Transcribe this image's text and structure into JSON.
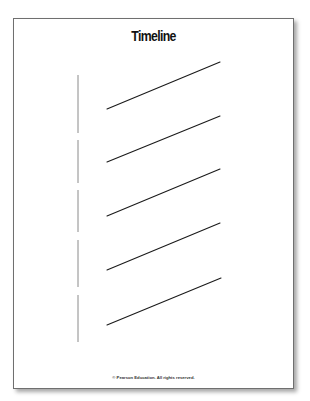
{
  "worksheet": {
    "title": "Timeline",
    "footer": "© Pearson Education. All rights reserved.",
    "colors": {
      "line": "#1a1a1a",
      "axis": "#8a8a8a",
      "border": "#6f6f6f",
      "background": "#ffffff"
    },
    "vertical_axis": {
      "x": 78,
      "segments": [
        {
          "y1": 75,
          "y2": 133
        },
        {
          "y1": 140,
          "y2": 183
        },
        {
          "y1": 190,
          "y2": 232
        },
        {
          "y1": 240,
          "y2": 287
        },
        {
          "y1": 295,
          "y2": 342
        }
      ]
    },
    "entry_lines": [
      {
        "x1": 107,
        "y1": 109,
        "x2": 220,
        "y2": 62
      },
      {
        "x1": 107,
        "y1": 162,
        "x2": 220,
        "y2": 116
      },
      {
        "x1": 107,
        "y1": 216,
        "x2": 220,
        "y2": 169
      },
      {
        "x1": 107,
        "y1": 270,
        "x2": 220,
        "y2": 223
      },
      {
        "x1": 107,
        "y1": 325,
        "x2": 221,
        "y2": 278
      }
    ]
  }
}
